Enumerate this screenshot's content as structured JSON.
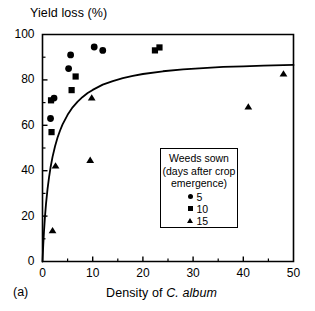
{
  "figure": {
    "panel_label": "(a)",
    "ylabel": "Yield loss (%)",
    "xlabel_prefix": "Density of ",
    "xlabel_species": "C. album"
  },
  "legend": {
    "title_line1": "Weeds sown",
    "title_line2": "(days after crop",
    "title_line3": "emergence)",
    "entries": [
      {
        "marker": "circle-marker",
        "label": "5"
      },
      {
        "marker": "square-marker",
        "label": "10"
      },
      {
        "marker": "triangle-marker",
        "label": "15"
      }
    ]
  },
  "chart_data": {
    "type": "scatter",
    "title": "",
    "xlabel": "Density of C. album",
    "ylabel": "Yield loss (%)",
    "xlim": [
      0,
      50
    ],
    "ylim": [
      0,
      100
    ],
    "xticks": [
      0,
      10,
      20,
      30,
      40,
      50
    ],
    "yticks": [
      0,
      20,
      40,
      60,
      80,
      100
    ],
    "xminor_interval": 5,
    "yminor_interval": 10,
    "grid": false,
    "legend_position": "inside-center-right",
    "marker_color": "#000000",
    "series": [
      {
        "name": "5",
        "legend_label": "5",
        "marker": "circle",
        "points": [
          [
            1.6,
            63.0
          ],
          [
            2.3,
            72.0
          ],
          [
            5.2,
            85.0
          ],
          [
            5.6,
            91.0
          ],
          [
            10.3,
            94.5
          ],
          [
            12.0,
            93.0
          ]
        ]
      },
      {
        "name": "10",
        "legend_label": "10",
        "marker": "square",
        "points": [
          [
            1.8,
            57.0
          ],
          [
            1.7,
            71.0
          ],
          [
            5.8,
            75.5
          ],
          [
            6.6,
            81.5
          ],
          [
            22.4,
            93.0
          ],
          [
            23.3,
            94.3
          ]
        ]
      },
      {
        "name": "15",
        "legend_label": "15",
        "marker": "triangle",
        "points": [
          [
            2.0,
            13.5
          ],
          [
            2.6,
            42.0
          ],
          [
            9.5,
            44.5
          ],
          [
            9.8,
            72.0
          ],
          [
            41.0,
            68.0
          ],
          [
            48.0,
            82.5
          ]
        ]
      }
    ],
    "fit_curve": {
      "name": "rectangular-hyperbola-fit",
      "model": "y = a*x / (1 + a*x/ymax)",
      "asymptote": 87.0,
      "initial_slope": 55.0,
      "points": [
        [
          0.0,
          0.0
        ],
        [
          0.15,
          7.3
        ],
        [
          0.3,
          13.4
        ],
        [
          0.5,
          20.0
        ],
        [
          0.7,
          25.4
        ],
        [
          1.0,
          31.9
        ],
        [
          1.3,
          37.1
        ],
        [
          1.6,
          41.4
        ],
        [
          2.0,
          46.1
        ],
        [
          2.5,
          50.8
        ],
        [
          3.0,
          54.6
        ],
        [
          3.5,
          57.7
        ],
        [
          4.0,
          60.4
        ],
        [
          5.0,
          64.6
        ],
        [
          6.0,
          67.9
        ],
        [
          7.0,
          70.4
        ],
        [
          8.0,
          72.5
        ],
        [
          9.0,
          74.2
        ],
        [
          10.0,
          75.6
        ],
        [
          12.0,
          77.9
        ],
        [
          14.0,
          79.5
        ],
        [
          16.0,
          80.8
        ],
        [
          18.0,
          81.8
        ],
        [
          20.0,
          82.6
        ],
        [
          24.0,
          83.8
        ],
        [
          28.0,
          84.6
        ],
        [
          32.0,
          85.2
        ],
        [
          36.0,
          85.7
        ],
        [
          40.0,
          86.0
        ],
        [
          44.0,
          86.3
        ],
        [
          48.0,
          86.5
        ],
        [
          50.0,
          86.6
        ]
      ]
    }
  }
}
